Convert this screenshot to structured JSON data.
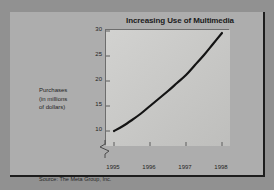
{
  "slide": {
    "source_note": "Source: The Meta Group, Inc."
  },
  "chart_data": {
    "type": "line",
    "title": "Increasing Use of Multimedia",
    "xlabel": "",
    "ylabel_lines": [
      "Purchases",
      "(in millions",
      "of dollars)"
    ],
    "ylabel": "Purchases (in millions of dollars)",
    "x": [
      1995,
      1996,
      1997,
      1998
    ],
    "xtick_labels": [
      "1995",
      "1996",
      "1997",
      "1998"
    ],
    "ytick_labels": [
      "30",
      "25",
      "20",
      "15",
      "10"
    ],
    "ytick_values": [
      30,
      25,
      20,
      15,
      10
    ],
    "ylim": [
      10,
      30
    ],
    "xlim": [
      1995,
      1998
    ],
    "yaxis_break": true,
    "grid": false,
    "legend": "none",
    "series": [
      {
        "name": "Multimedia purchases",
        "color": "#141414",
        "values": [
          10.0,
          15.0,
          21.2,
          29.6
        ],
        "points": [
          {
            "x": 1995.0,
            "y": 10.0
          },
          {
            "x": 1995.25,
            "y": 11.0
          },
          {
            "x": 1995.5,
            "y": 12.2
          },
          {
            "x": 1995.75,
            "y": 13.5
          },
          {
            "x": 1996.0,
            "y": 15.0
          },
          {
            "x": 1996.25,
            "y": 16.5
          },
          {
            "x": 1996.5,
            "y": 18.0
          },
          {
            "x": 1996.75,
            "y": 19.6
          },
          {
            "x": 1997.0,
            "y": 21.2
          },
          {
            "x": 1997.25,
            "y": 23.2
          },
          {
            "x": 1997.5,
            "y": 25.2
          },
          {
            "x": 1997.75,
            "y": 27.4
          },
          {
            "x": 1998.0,
            "y": 29.6
          }
        ]
      }
    ]
  },
  "colors": {
    "background": "#919191",
    "panel": "#adadad",
    "plot_background": "#c8c8c6",
    "axis": "#6d6d6d",
    "line": "#141414",
    "text": "#1f1f1f"
  }
}
